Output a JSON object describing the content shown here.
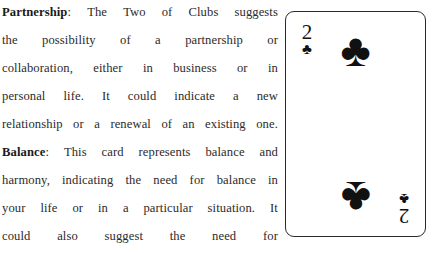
{
  "document": {
    "paragraphs": [
      {
        "lead_in": "Partnership",
        "separator": ":",
        "lines": [
          {
            "words": [
              "The",
              "Two",
              "of",
              "Clubs",
              "suggests"
            ],
            "justified": true
          },
          {
            "words": [
              "the",
              "possibility",
              "of",
              "a",
              "partnership",
              "or"
            ],
            "justified": true
          },
          {
            "words": [
              "collaboration,",
              "either",
              "in",
              "business",
              "or",
              "in"
            ],
            "justified": true
          },
          {
            "words": [
              "personal",
              "life.",
              "It",
              "could",
              "indicate",
              "a",
              "new"
            ],
            "justified": true
          },
          {
            "words": [
              "relationship",
              "or",
              "a",
              "renewal",
              "of",
              "an",
              "existing",
              "one."
            ],
            "justified": true
          }
        ]
      },
      {
        "lead_in": "Balance",
        "separator": ":",
        "lines": [
          {
            "words": [
              "This",
              "card",
              "represents",
              "balance",
              "and"
            ],
            "justified": true
          },
          {
            "words": [
              "harmony,",
              "indicating",
              "the",
              "need",
              "for",
              "balance",
              "in"
            ],
            "justified": true
          },
          {
            "words": [
              "your",
              "life",
              "or",
              "in",
              "a",
              "particular",
              "situation.",
              "It"
            ],
            "justified": true
          },
          {
            "words": [
              "could",
              "also",
              "suggest",
              "the",
              "need",
              "for"
            ],
            "justified": true
          }
        ]
      }
    ],
    "full_text": "Partnership: The Two of Clubs suggests the possibility of a partnership or collaboration, either in business or in personal life. It could indicate a new relationship or a renewal of an existing one. Balance: This card represents balance and harmony, indicating the need for balance in your life or in a particular situation. It could also suggest the need for",
    "clipped_last_line": [
      "",
      "",
      "",
      "",
      "",
      ""
    ],
    "text_color": "#2b2b2b",
    "lead_in_color": "#1a1a1a"
  },
  "card": {
    "rank": "2",
    "rank_name": "Two",
    "suit_symbol": "♣",
    "suit_name": "Clubs",
    "card_name": "Two of Clubs",
    "color": "#111111",
    "border_color": "#2a2a2a",
    "background": "#ffffff",
    "pip_count": 2,
    "indices": [
      {
        "position": "top-left",
        "rank": "2",
        "suit": "♣",
        "rotated": false
      },
      {
        "position": "bottom-right",
        "rank": "2",
        "suit": "♣",
        "rotated": true
      }
    ],
    "pips": [
      {
        "position": "top-center",
        "suit": "♣",
        "rotated": false
      },
      {
        "position": "bottom-center",
        "suit": "♣",
        "rotated": true
      }
    ]
  }
}
